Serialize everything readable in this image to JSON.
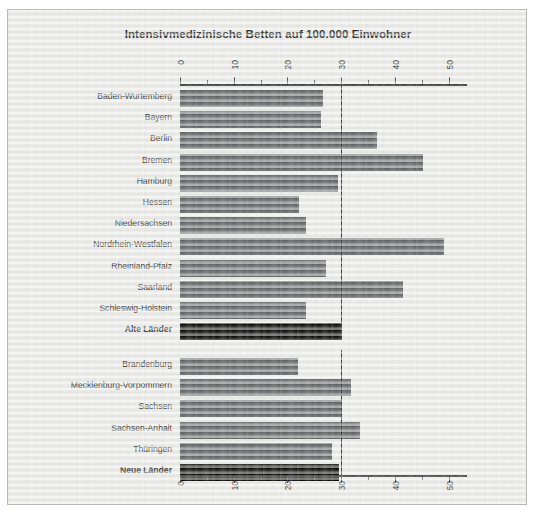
{
  "chart_data": {
    "type": "bar",
    "orientation": "horizontal",
    "title": "Intensivmedizinische Betten auf 100.000 Einwohner",
    "xlabel": "",
    "ylabel": "",
    "xlim": [
      0,
      53
    ],
    "grid": false,
    "legend": null,
    "tick_labels": [
      "0",
      "10",
      "20",
      "30",
      "40",
      "50"
    ],
    "tick_values": [
      0,
      10,
      20,
      30,
      40,
      50
    ],
    "minor_tick_values": [
      5,
      15,
      25,
      35,
      45
    ],
    "reference_line": 30,
    "groups": [
      {
        "name": "Alte Länder",
        "categories": [
          "Baden-Wurtemberg",
          "Bayern",
          "Berlin",
          "Bremen",
          "Hamburg",
          "Hessen",
          "Niedersachsen",
          "Nordrhein-Westfalen",
          "Rheinland-Pfalz",
          "Saarland",
          "Schleswig-Holstein",
          "Alte Länder"
        ],
        "values": [
          26.6,
          26.2,
          36.7,
          45.3,
          29.4,
          22.2,
          23.5,
          49.2,
          27.2,
          41.5,
          23.5,
          30.0
        ],
        "highlight_index": 11
      },
      {
        "name": "Neue Länder",
        "categories": [
          "Brandenburg",
          "Mecklenburg-Vorpommern",
          "Sachsen",
          "Sachsen-Anhalt",
          "Thüringen",
          "Neue Länder"
        ],
        "values": [
          22.0,
          31.8,
          30.0,
          33.5,
          28.3,
          29.6
        ],
        "highlight_index": 5
      }
    ],
    "colors": {
      "bar": "#5b5d60",
      "bar_highlight": "#000000",
      "axis": "#3a3c3e",
      "reference_line": "#111314",
      "background": "#eeeeec",
      "text": "#1d1f21"
    }
  }
}
